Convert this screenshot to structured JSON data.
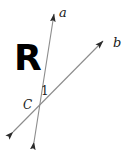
{
  "figure": {
    "type": "geometry-diagram",
    "background_color": "#ffffff",
    "line_color": "#808080",
    "label_color": "#1a1a1a",
    "region_label": "R",
    "labels": {
      "ray_a": "a",
      "ray_b": "b",
      "angle": "1",
      "vertex": "C"
    },
    "lines": [
      {
        "name": "line-a",
        "label": "a",
        "from_x": 33,
        "from_y": 148,
        "to_x": 55,
        "to_y": 8,
        "arrow_start": true,
        "arrow_end": true
      },
      {
        "name": "line-b",
        "label": "b",
        "from_x": 8,
        "from_y": 137,
        "to_x": 108,
        "to_y": 36,
        "arrow_start": true,
        "arrow_end": true
      }
    ],
    "points": [
      {
        "name": "C",
        "x": 39,
        "y": 108
      }
    ]
  }
}
